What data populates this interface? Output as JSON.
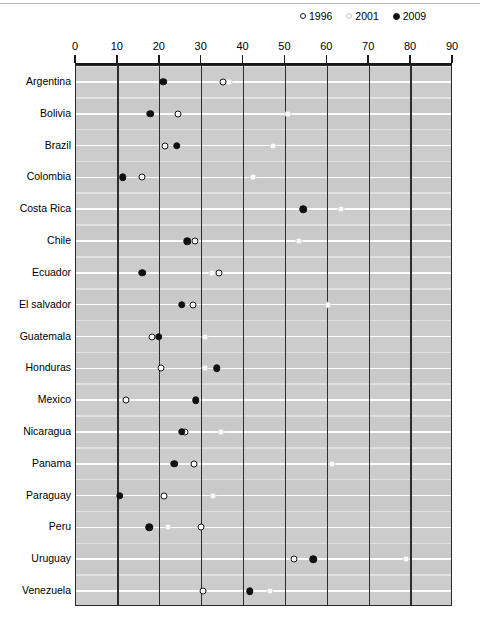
{
  "chart_data": {
    "type": "scatter",
    "title": "",
    "subtitle": "",
    "xlabel": "",
    "ylabel": "",
    "orientation": "horizontal",
    "xlim": [
      0,
      90
    ],
    "xticks": [
      0,
      10,
      20,
      30,
      40,
      50,
      60,
      70,
      80,
      90
    ],
    "grid": "vertical gridlines at every x tick; white horizontal separators between country rows",
    "legend_position": "top-right",
    "plot_background": "#c9c9c9",
    "categories": [
      "Argentina",
      "Bolivia",
      "Brazil",
      "Colombia",
      "Costa Rica",
      "Chile",
      "Ecuador",
      "El salvador",
      "Guatemala",
      "Honduras",
      "Mexico",
      "Nicaragua",
      "Panama",
      "Paraguay",
      "Peru",
      "Uruguay",
      "Venezuela"
    ],
    "series": [
      {
        "name": "1996",
        "marker": "open-circle-dark",
        "color": "#141414",
        "values": [
          35.0,
          24.4,
          21.2,
          15.8,
          null,
          28.4,
          34.1,
          28.0,
          18.1,
          20.3,
          12.0,
          26.0,
          28.2,
          21.0,
          29.8,
          52.0,
          30.3
        ]
      },
      {
        "name": "2001",
        "marker": "open-circle-light",
        "color": "#d2d2d2",
        "values": [
          36.5,
          50.6,
          47.0,
          42.2,
          63.2,
          53.2,
          32.5,
          60.1,
          30.8,
          30.8,
          null,
          34.6,
          61.2,
          32.7,
          22.0,
          78.8,
          46.3
        ]
      },
      {
        "name": "2009",
        "marker": "filled-circle",
        "color": "#101010",
        "values": [
          20.8,
          17.7,
          24.0,
          11.2,
          54.2,
          26.5,
          15.8,
          25.3,
          19.8,
          33.6,
          28.6,
          25.2,
          23.4,
          10.5,
          17.5,
          56.6,
          41.5
        ]
      }
    ]
  },
  "legend": {
    "items": [
      {
        "label": "1996",
        "marker": "open-circle-dark-icon"
      },
      {
        "label": "2001",
        "marker": "open-circle-light-icon"
      },
      {
        "label": "2009",
        "marker": "filled-circle-icon"
      }
    ]
  }
}
